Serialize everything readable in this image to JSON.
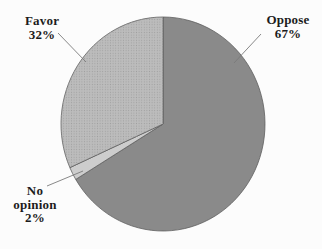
{
  "chart_data": {
    "type": "pie",
    "title": "",
    "slices": [
      {
        "label": "Oppose",
        "value": 67,
        "pct_text": "67%",
        "color": "#8a8a8a",
        "pattern": "none"
      },
      {
        "label": "No opinion",
        "value": 2,
        "pct_text": "2%",
        "color": "#cdcdcd",
        "pattern": "none"
      },
      {
        "label": "Favor",
        "value": 32,
        "pct_text": "32%",
        "color": "#bcbcbc",
        "pattern": "dots",
        "pattern_dot_color": "#a0a0a0"
      }
    ],
    "start_angle_deg": 0,
    "direction": "clockwise",
    "legend": "none",
    "labels": "external-callouts-with-leader-lines",
    "stroke_color": "#5e5e5e",
    "leader_line_color": "#7a7a7a",
    "label_color": "#1c1c1c",
    "background_color": "#fcfcfc"
  }
}
